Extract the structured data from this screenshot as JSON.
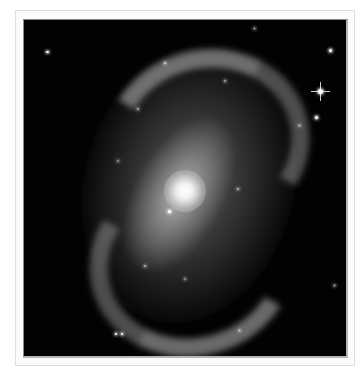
{
  "image": {
    "subject": "barred spiral galaxy",
    "description": "Grayscale photograph of a barred spiral galaxy with a bright core and clumpy spiral arms, set against a black starfield, shown in a light gray frame",
    "colors": {
      "background": "#ffffff",
      "frame": "#fbfbfb",
      "frame_border": "#dedede",
      "sky": "#020202",
      "core": "#ffffff"
    },
    "stars": [
      {
        "name": "upper-left-star",
        "x": 47,
        "y": 51
      },
      {
        "name": "upper-right-star",
        "x": 329,
        "y": 49
      },
      {
        "name": "bright-spiked-star",
        "x": 319,
        "y": 90
      },
      {
        "name": "right-small-star",
        "x": 315,
        "y": 116
      },
      {
        "name": "bottom-pair-star-1",
        "x": 115,
        "y": 333
      },
      {
        "name": "bottom-pair-star-2",
        "x": 120,
        "y": 333
      },
      {
        "name": "inner-bright-star",
        "x": 168,
        "y": 210
      }
    ]
  }
}
